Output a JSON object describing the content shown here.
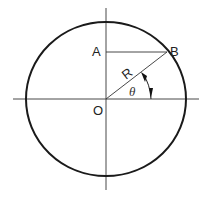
{
  "diagram": {
    "title": "",
    "labels": {
      "point_a": "A",
      "point_b": "B",
      "origin": "O",
      "radius": "R",
      "angle": "θ"
    },
    "colors": {
      "circle": "#1a1a1a",
      "axes": "#333333",
      "lines": "#333333",
      "text": "#222222",
      "background": "#ffffff"
    },
    "geometry": {
      "center": [
        106,
        99
      ],
      "circle_radius_x": 80,
      "circle_radius_y": 77,
      "point_b": [
        167,
        52
      ],
      "point_a": [
        106,
        52
      ]
    }
  }
}
